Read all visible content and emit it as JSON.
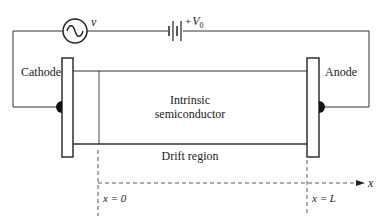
{
  "diagram": {
    "type": "circuit-schematic",
    "colors": {
      "line": "#333333",
      "text": "#222222",
      "background": "#ffffff"
    },
    "source": {
      "label": "v",
      "icon": "ac-source-icon"
    },
    "battery": {
      "label_sign": "+",
      "label_var": "V",
      "label_sub": "0",
      "icon": "battery-icon"
    },
    "electrodes": {
      "cathode": "Cathode",
      "anode": "Anode"
    },
    "semiconductor": {
      "line1": "Intrinsic",
      "line2": "semiconductor"
    },
    "region_label": "Drift region",
    "axis": {
      "label": "x",
      "start_label": "x = 0",
      "end_label": "x = L"
    }
  }
}
